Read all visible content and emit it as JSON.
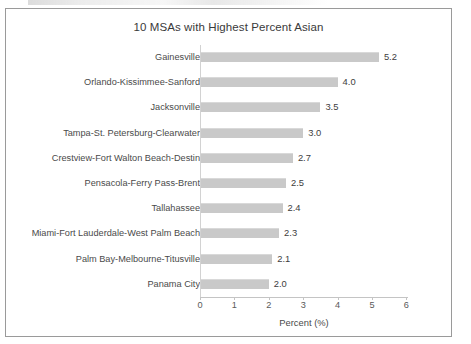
{
  "chart_data": {
    "type": "bar",
    "orientation": "horizontal",
    "title": "10 MSAs with Highest Percent Asian",
    "xlabel": "Percent (%)",
    "ylabel": "",
    "xlim": [
      0,
      6
    ],
    "xticks": [
      "0",
      "1",
      "2",
      "3",
      "4",
      "5",
      "6"
    ],
    "grid": false,
    "legend": false,
    "bar_color": "#c9c9c9",
    "categories": [
      "Gainesville",
      "Orlando-Kissimmee-Sanford",
      "Jacksonville",
      "Tampa-St. Petersburg-Clearwater",
      "Crestview-Fort Walton Beach-Destin",
      "Pensacola-Ferry Pass-Brent",
      "Tallahassee",
      "Miami-Fort Lauderdale-West Palm Beach",
      "Palm Bay-Melbourne-Titusville",
      "Panama City"
    ],
    "values": [
      5.2,
      4.0,
      3.5,
      3.0,
      2.7,
      2.5,
      2.4,
      2.3,
      2.1,
      2.0
    ],
    "value_labels": [
      "5.2",
      "4.0",
      "3.5",
      "3.0",
      "2.7",
      "2.5",
      "2.4",
      "2.3",
      "2.1",
      "2.0"
    ]
  }
}
